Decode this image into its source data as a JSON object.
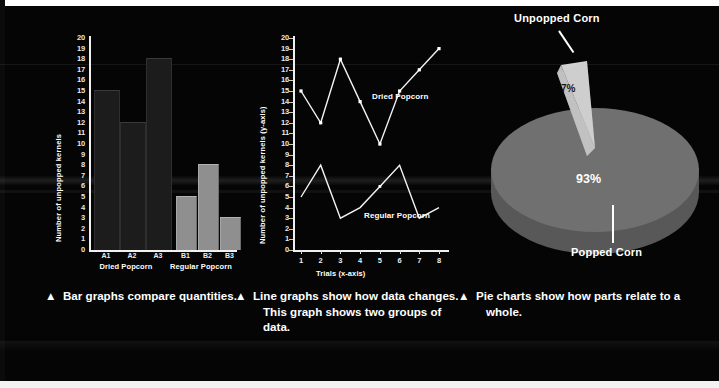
{
  "figure": {
    "background_color": "#050505",
    "text_color": "#ffffff"
  },
  "bar_panel": {
    "caption_marker": "▲",
    "caption": "Bar graphs compare quantities.",
    "group_labels": [
      "Dried Popcorn",
      "Regular Popcorn"
    ],
    "colors": {
      "dried": "#1c1c1c",
      "regular": "#8f8f8f"
    }
  },
  "line_panel": {
    "caption_marker": "▲",
    "caption": "Line graphs show how data changes. This graph shows two groups of data.",
    "series_labels": [
      "Dried Popcorn",
      "Regular Popcorn"
    ],
    "colors": {
      "line": "#f2f2f2",
      "marker": "#ffffff"
    }
  },
  "pie_panel": {
    "caption_marker": "▲",
    "caption": "Pie charts show how parts relate to a whole.",
    "label_top": "Unpopped Corn",
    "label_bottom": "Popped Corn",
    "value_small": "7%",
    "value_large": "93%",
    "colors": {
      "popped": "#707070",
      "popped_side": "#585858",
      "unpopped": "#d2d2d2",
      "unpopped_side": "#b4b4b4"
    }
  },
  "chart_data": [
    {
      "type": "bar",
      "title": "",
      "xlabel": "",
      "ylabel": "Number of unpopped kernels",
      "categories": [
        "A1",
        "A2",
        "A3",
        "B1",
        "B2",
        "B3"
      ],
      "values": [
        15,
        12,
        18,
        5,
        8,
        3
      ],
      "series": [
        {
          "name": "Dried Popcorn",
          "categories": [
            "A1",
            "A2",
            "A3"
          ],
          "values": [
            15,
            12,
            18
          ],
          "color": "#1c1c1c"
        },
        {
          "name": "Regular Popcorn",
          "categories": [
            "B1",
            "B2",
            "B3"
          ],
          "values": [
            5,
            8,
            3
          ],
          "color": "#8f8f8f"
        }
      ],
      "ylim": [
        0,
        20
      ],
      "yticks": [
        0,
        1,
        2,
        3,
        4,
        5,
        6,
        7,
        8,
        9,
        10,
        11,
        12,
        13,
        14,
        15,
        16,
        17,
        18,
        19,
        20
      ],
      "grid": false,
      "legend": "none"
    },
    {
      "type": "line",
      "title": "",
      "xlabel": "Trials (x-axis)",
      "ylabel": "Number of unpopped kernels (y-axis)",
      "x": [
        1,
        2,
        3,
        4,
        5,
        6,
        7,
        8
      ],
      "series": [
        {
          "name": "Dried Popcorn",
          "values": [
            15,
            12,
            18,
            14,
            10,
            15,
            17,
            19
          ]
        },
        {
          "name": "Regular Popcorn",
          "values": [
            5,
            8,
            3,
            4,
            6,
            8,
            3,
            4
          ]
        }
      ],
      "xlim": [
        1,
        8
      ],
      "ylim": [
        0,
        20
      ],
      "yticks": [
        0,
        1,
        2,
        3,
        4,
        5,
        6,
        7,
        8,
        9,
        10,
        11,
        12,
        13,
        14,
        15,
        16,
        17,
        18,
        19,
        20
      ],
      "xticks": [
        1,
        2,
        3,
        4,
        5,
        6,
        7,
        8
      ],
      "grid": false,
      "legend": "inline-annotations"
    },
    {
      "type": "pie",
      "title": "",
      "labels": [
        "Popped Corn",
        "Unpopped Corn"
      ],
      "values": [
        93,
        7
      ],
      "value_labels": [
        "93%",
        "7%"
      ],
      "colors": [
        "#707070",
        "#d2d2d2"
      ],
      "exploded": [
        "Unpopped Corn"
      ],
      "legend": "callout-labels"
    }
  ]
}
